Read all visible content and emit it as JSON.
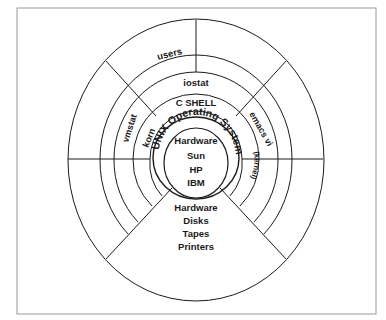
{
  "diagram": {
    "type": "concentric-layers",
    "colors": {
      "line": "#1a1a1a",
      "frame": "#9a9a9a",
      "background": "#ffffff"
    },
    "layers": {
      "outer_top": {
        "label": "users"
      },
      "ring_iostat": {
        "label": "iostat"
      },
      "ring_vmstat": {
        "label": "vmstat"
      },
      "ring_emacs": {
        "label": "emacs vi"
      },
      "ring_cshell": {
        "label": "C SHELL"
      },
      "ring_korn": {
        "label": "korn"
      },
      "kernel_ring": {
        "label": "UNIX Operating System",
        "sublabel": "(kernel)"
      },
      "core": {
        "title": "Hardware",
        "items": [
          "Sun",
          "HP",
          "IBM"
        ]
      },
      "bottom_wedge": {
        "title": "Hardware",
        "items": [
          "Disks",
          "Tapes",
          "Printers"
        ]
      }
    }
  }
}
